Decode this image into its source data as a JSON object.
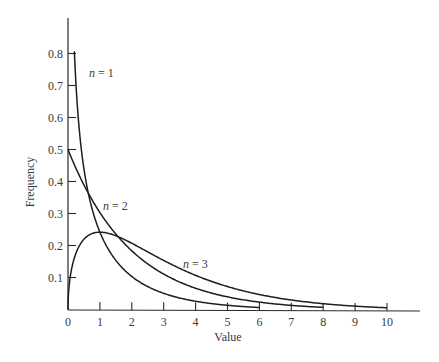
{
  "chart_data": {
    "type": "line",
    "title": "",
    "xlabel": "Value",
    "ylabel": "Frequency",
    "xlim": [
      0,
      10
    ],
    "ylim": [
      0,
      0.8
    ],
    "grid": false,
    "legend": "inline curve labels",
    "x_ticks": [
      "0",
      "1",
      "2",
      "3",
      "4",
      "5",
      "6",
      "7",
      "8",
      "9",
      "10"
    ],
    "y_ticks": [
      "0.1",
      "0.2",
      "0.3",
      "0.4",
      "0.5",
      "0.6",
      "0.7",
      "0.8"
    ],
    "series": [
      {
        "name": "n = 1",
        "x": [
          0.2,
          0.3,
          0.5,
          0.75,
          1,
          1.5,
          2,
          3,
          4,
          5,
          6
        ],
        "values": [
          0.8,
          0.63,
          0.44,
          0.32,
          0.24,
          0.15,
          0.1,
          0.05,
          0.03,
          0.015,
          0.008
        ]
      },
      {
        "name": "n = 2",
        "x": [
          0,
          0.5,
          1,
          1.5,
          2,
          3,
          4,
          5,
          6,
          7,
          8
        ],
        "values": [
          0.5,
          0.39,
          0.3,
          0.24,
          0.18,
          0.11,
          0.07,
          0.04,
          0.025,
          0.015,
          0.009
        ]
      },
      {
        "name": "n = 3",
        "x": [
          0,
          0.1,
          0.25,
          0.5,
          1,
          1.5,
          2,
          3,
          4,
          5,
          6,
          7,
          8,
          9,
          10
        ],
        "values": [
          0,
          0.12,
          0.18,
          0.22,
          0.24,
          0.23,
          0.21,
          0.15,
          0.11,
          0.07,
          0.05,
          0.03,
          0.02,
          0.013,
          0.008
        ]
      }
    ],
    "annotations": [
      {
        "text_var": "n",
        "text_rest": " = 1",
        "series": "n = 1"
      },
      {
        "text_var": "n",
        "text_rest": " = 2",
        "series": "n = 2"
      },
      {
        "text_var": "n",
        "text_rest": " = 3",
        "series": "n = 3"
      }
    ]
  }
}
